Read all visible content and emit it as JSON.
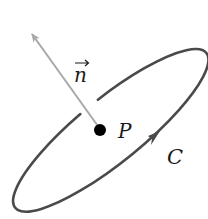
{
  "diagram": {
    "labels": {
      "normal_vector": "n",
      "point": "P",
      "curve": "C"
    },
    "colors": {
      "curve": "#4a4a4a",
      "normal_arrow": "#a8a8a8",
      "point": "#000000",
      "text": "#1a1a1a"
    },
    "elements": [
      {
        "type": "closed-curve",
        "name": "C",
        "shape": "tilted ellipse",
        "orientation": "counter-clockwise arrow"
      },
      {
        "type": "point",
        "name": "P",
        "position": "center of curve"
      },
      {
        "type": "vector",
        "name": "n",
        "description": "normal vector from P, pointing up-left"
      }
    ]
  }
}
